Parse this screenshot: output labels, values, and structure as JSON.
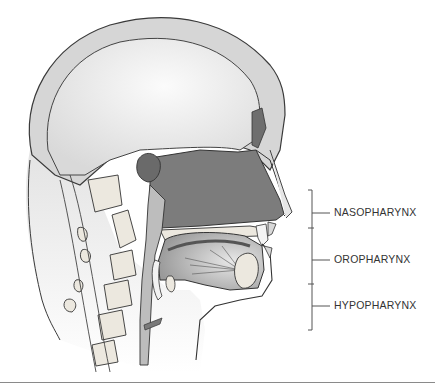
{
  "figure": {
    "labels": [
      {
        "text": "NASOPHARYNX",
        "y": 213
      },
      {
        "text": "OROPHARYNX",
        "y": 260
      },
      {
        "text": "HYPOPHARYNX",
        "y": 306
      }
    ],
    "colors": {
      "outline": "#3a3a3a",
      "skull": "#d8d8d8",
      "brain": "#efefef",
      "cavity": "#7a7a7a",
      "tissue": "#c4c4c4",
      "bone": "#e8e4dc",
      "bracket": "#555555"
    }
  }
}
